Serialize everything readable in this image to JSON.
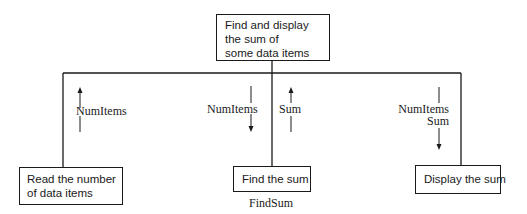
{
  "diagram": {
    "type": "structure chart",
    "root": {
      "lines": [
        "Find and display",
        "the sum of",
        "some data items"
      ]
    },
    "modules": [
      {
        "id": "read",
        "lines": [
          "Read the number",
          "of data items"
        ],
        "flows": [
          {
            "label": "NumItems",
            "direction": "up"
          }
        ]
      },
      {
        "id": "findsum",
        "lines": [
          "Find the sum"
        ],
        "caption": "FindSum",
        "flows": [
          {
            "label": "NumItems",
            "direction": "down"
          },
          {
            "label": "Sum",
            "direction": "up"
          }
        ]
      },
      {
        "id": "display",
        "lines": [
          "Display the sum"
        ],
        "flows": [
          {
            "label": "NumItems",
            "direction": "down"
          },
          {
            "label": "Sum",
            "direction": "down"
          }
        ]
      }
    ]
  }
}
